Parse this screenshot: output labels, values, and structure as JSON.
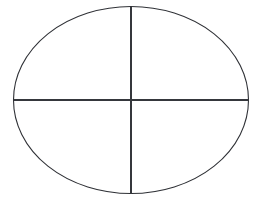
{
  "figure": {
    "kind": "geometry-diagram",
    "canvas": {
      "width": 254,
      "height": 204,
      "background_color": "#ffffff"
    },
    "ellipse": {
      "name": "ellipse-outline",
      "center_x": 131,
      "center_y": 100,
      "radius_x": 117.5,
      "radius_y": 93.5,
      "stroke_color": "#2f3136",
      "stroke_width": 1.1,
      "fill": "none"
    },
    "major_axis": {
      "name": "horizontal-axis-line",
      "orientation": "horizontal",
      "x1": 13.5,
      "y1": 100,
      "x2": 248.5,
      "y2": 100,
      "stroke_color": "#35373c",
      "stroke_width": 1.3
    },
    "minor_axis": {
      "name": "vertical-axis-line",
      "orientation": "vertical",
      "x1": 131,
      "y1": 6.5,
      "x2": 131,
      "y2": 193.5,
      "stroke_color": "#35373c",
      "stroke_width": 1.3
    },
    "vertices": {
      "left": {
        "x": 13.5,
        "y": 100
      },
      "right": {
        "x": 248.5,
        "y": 100
      },
      "top": {
        "x": 131,
        "y": 6.5
      },
      "bottom": {
        "x": 131,
        "y": 193.5
      }
    },
    "labels": []
  }
}
